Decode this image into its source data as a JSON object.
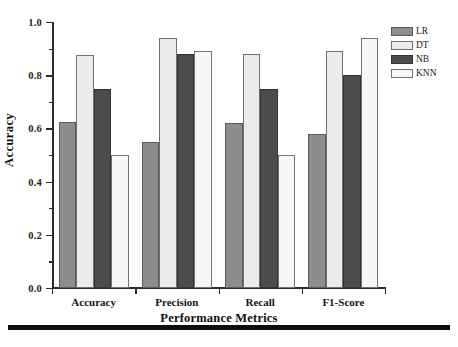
{
  "chart_data": {
    "type": "bar",
    "title": "",
    "xlabel": "Performance Metrics",
    "ylabel": "Accuracy",
    "categories": [
      "Accuracy",
      "Precision",
      "Recall",
      "F1-Score"
    ],
    "series": [
      {
        "name": "LR",
        "color": "#8d8d8d",
        "values": [
          0.625,
          0.55,
          0.62,
          0.58
        ]
      },
      {
        "name": "DT",
        "color": "#ebebeb",
        "values": [
          0.875,
          0.94,
          0.88,
          0.89
        ]
      },
      {
        "name": "NB",
        "color": "#4c4c4c",
        "values": [
          0.75,
          0.88,
          0.75,
          0.8
        ]
      },
      {
        "name": "KNN",
        "color": "#f7f7f7",
        "values": [
          0.5,
          0.89,
          0.5,
          0.94
        ]
      }
    ],
    "ylim": [
      0.0,
      1.0
    ],
    "ytick_labels": [
      "0.0",
      "0.2",
      "0.4",
      "0.6",
      "0.8",
      "1.0"
    ],
    "ytick_values": [
      0.0,
      0.2,
      0.4,
      0.6,
      0.8,
      1.0
    ],
    "yminor_values": [
      0.1,
      0.3,
      0.5,
      0.7,
      0.9
    ],
    "grid": false,
    "legend_position": "outside-top-right",
    "legend_entries": [
      "LR",
      "DT",
      "NB",
      "KNN"
    ]
  },
  "axes": {
    "y_title": "Accuracy",
    "x_title": "Performance Metrics"
  },
  "legend": {
    "items": [
      {
        "label": "LR"
      },
      {
        "label": "DT"
      },
      {
        "label": "NB"
      },
      {
        "label": "KNN"
      }
    ]
  }
}
